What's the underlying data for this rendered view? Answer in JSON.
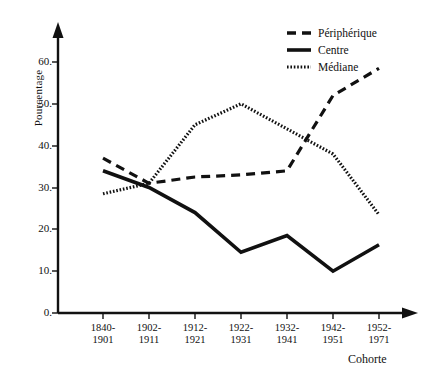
{
  "chart_data": {
    "type": "line",
    "title": "",
    "xlabel": "Cohorte",
    "ylabel": "Pourcentage",
    "categories": [
      "1840-\n1901",
      "1902-\n1911",
      "1912-\n1921",
      "1922-\n1931",
      "1932-\n1941",
      "1942-\n1951",
      "1952-\n1971"
    ],
    "category_lines": [
      [
        "1840-",
        "1901"
      ],
      [
        "1902-",
        "1911"
      ],
      [
        "1912-",
        "1921"
      ],
      [
        "1922-",
        "1931"
      ],
      [
        "1932-",
        "1941"
      ],
      [
        "1942-",
        "1951"
      ],
      [
        "1952-",
        "1971"
      ]
    ],
    "ylim": [
      0,
      60
    ],
    "yticks": [
      0,
      10,
      20,
      30,
      40,
      50,
      60
    ],
    "ytick_labels": [
      "0.",
      "10.",
      "20.",
      "30.",
      "40.",
      "50.",
      "60."
    ],
    "grid": false,
    "legend_position": "top-right",
    "series": [
      {
        "name": "Périphérique",
        "style": "dashed",
        "color": "#111111",
        "values": [
          37.0,
          31.0,
          32.5,
          33.0,
          34.0,
          52.0,
          58.5
        ]
      },
      {
        "name": "Centre",
        "style": "solid",
        "color": "#111111",
        "values": [
          34.0,
          30.0,
          24.0,
          14.5,
          18.5,
          10.0,
          16.3
        ]
      },
      {
        "name": "Médiane",
        "style": "dotted",
        "color": "#111111",
        "values": [
          28.5,
          31.0,
          45.0,
          50.0,
          44.0,
          38.0,
          23.5
        ]
      }
    ]
  },
  "axis": {
    "ylabel": "Pourcentage",
    "xlabel": "Cohorte",
    "ytick_labels": [
      "60.",
      "50.",
      "40.",
      "30.",
      "20.",
      "10.",
      "0."
    ]
  },
  "legend": {
    "items": [
      {
        "label": "Périphérique",
        "key": "dashed-line-key"
      },
      {
        "label": "Centre",
        "key": "solid-line-key"
      },
      {
        "label": "Médiane",
        "key": "dotted-line-key"
      }
    ]
  }
}
